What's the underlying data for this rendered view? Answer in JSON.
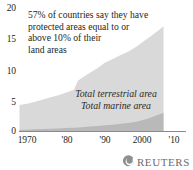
{
  "chart_data": {
    "type": "area",
    "title": "",
    "subtitle": "",
    "xlabel": "",
    "ylabel": "",
    "stacked": true,
    "grid": false,
    "legend_position": "inside-center",
    "xlim": [
      1970,
      2010
    ],
    "ylim": [
      0,
      20
    ],
    "yticks": [
      "0",
      "5",
      "10",
      "15",
      "20"
    ],
    "ytick_values": [
      0,
      5,
      10,
      15,
      20
    ],
    "xticks": [
      "1970",
      "'80",
      "'90",
      "2000",
      "'10"
    ],
    "xtick_values": [
      1970,
      1980,
      1990,
      2000,
      2010
    ],
    "x": [
      1970,
      1972,
      1974,
      1976,
      1978,
      1980,
      1982,
      1984,
      1985,
      1986,
      1988,
      1990,
      1992,
      1994,
      1996,
      1998,
      2000,
      2002,
      2004,
      2006,
      2007
    ],
    "series": [
      {
        "name": "Total marine area",
        "color": "#b9b9b9",
        "values": [
          0.3,
          0.3,
          0.35,
          0.4,
          0.45,
          0.5,
          0.55,
          0.6,
          0.65,
          0.7,
          0.8,
          0.9,
          1.0,
          1.1,
          1.25,
          1.4,
          1.6,
          1.9,
          2.3,
          2.8,
          3.0
        ]
      },
      {
        "name": "Total terrestrial area",
        "color": "#d9d9d9",
        "values": [
          4.0,
          4.2,
          4.5,
          4.8,
          5.1,
          5.4,
          5.8,
          6.2,
          7.6,
          8.0,
          8.7,
          9.4,
          10.2,
          10.7,
          11.2,
          11.6,
          12.2,
          12.8,
          13.3,
          13.8,
          14.1
        ]
      }
    ],
    "annotation": {
      "lines": [
        "57% of countries say they have",
        "protected areas equal to or",
        "above 10% of their",
        "land areas"
      ]
    }
  },
  "legend": {
    "terrestrial": "Total terrestrial area",
    "marine": "Total marine area"
  },
  "credit": {
    "wordmark": "REUTERS",
    "logo_icon": "reuters-swirl-icon"
  },
  "colors": {
    "terrestrial_fill": "#d9d9d9",
    "marine_fill": "#b9b9b9",
    "axis": "#8a8a8a",
    "text": "#231f20",
    "logo": "#6b6b6b"
  }
}
